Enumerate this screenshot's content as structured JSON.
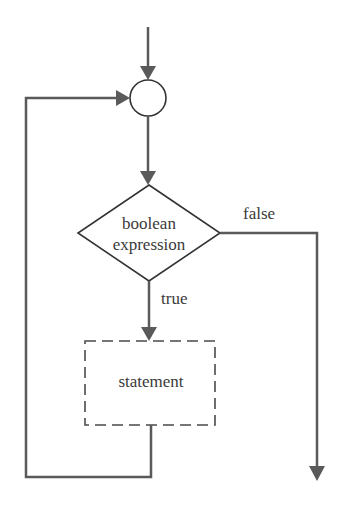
{
  "diagram": {
    "type": "flowchart",
    "title": "",
    "colors": {
      "line": "#5a5a5a",
      "shape_stroke": "#333333",
      "text": "#3a3a3a",
      "background": "#ffffff"
    },
    "nodes": {
      "junction": {
        "shape": "circle",
        "label": ""
      },
      "condition": {
        "shape": "diamond",
        "line1": "boolean",
        "line2": "expression"
      },
      "statement": {
        "shape": "dashed-rectangle",
        "label": "statement"
      }
    },
    "edges": {
      "true_label": "true",
      "false_label": "false"
    }
  }
}
